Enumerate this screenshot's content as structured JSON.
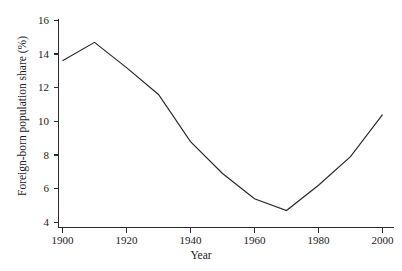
{
  "chart_data": {
    "type": "line",
    "title": "",
    "xlabel": "Year",
    "ylabel": "Foreign-born population share (%)",
    "x": [
      1900,
      1910,
      1920,
      1930,
      1940,
      1950,
      1960,
      1970,
      1980,
      1990,
      2000
    ],
    "values": [
      13.6,
      14.7,
      13.2,
      11.6,
      8.8,
      6.9,
      5.4,
      4.7,
      6.2,
      7.9,
      10.4
    ],
    "series": [
      {
        "name": "Foreign-born population share",
        "values": [
          13.6,
          14.7,
          13.2,
          11.6,
          8.8,
          6.9,
          5.4,
          4.7,
          6.2,
          7.9,
          10.4
        ]
      }
    ],
    "xlim": [
      1900,
      2000
    ],
    "ylim": [
      4,
      16
    ],
    "xticks": [
      1900,
      1920,
      1940,
      1960,
      1980,
      2000
    ],
    "yticks": [
      4,
      6,
      8,
      10,
      12,
      14,
      16
    ],
    "xtick_labels": [
      "1900",
      "1920",
      "1940",
      "1960",
      "1980",
      "2000"
    ],
    "ytick_labels": [
      "4",
      "6",
      "8",
      "10",
      "12",
      "14",
      "16"
    ],
    "grid": false,
    "legend": "none",
    "line_color": "#262626",
    "axis_color": "#2a2a2a",
    "background": "#ffffff"
  },
  "axes": {
    "y_title": "Foreign-born population share (%)",
    "x_title": "Year"
  }
}
